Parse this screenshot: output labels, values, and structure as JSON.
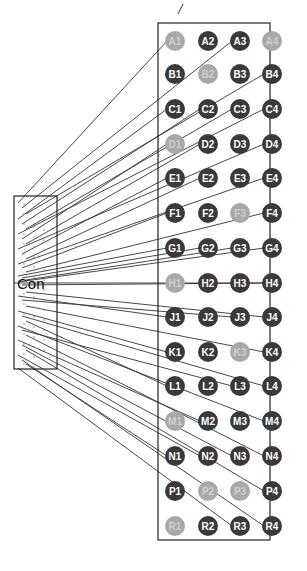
{
  "connector": {
    "label": "Con",
    "box": {
      "x": 14,
      "y": 196,
      "w": 43,
      "h": 173
    }
  },
  "grid": {
    "box": {
      "x": 158,
      "y": 23,
      "w": 112,
      "h": 517
    },
    "columns": [
      1,
      2,
      3,
      4
    ],
    "column_x": [
      175,
      208,
      240,
      272
    ],
    "row_letters": [
      "A",
      "B",
      "C",
      "D",
      "E",
      "F",
      "G",
      "H",
      "J",
      "K",
      "L",
      "M",
      "N",
      "P",
      "R"
    ],
    "row_y": [
      41,
      74,
      109,
      144,
      178,
      213,
      248,
      283,
      317,
      352,
      386,
      421,
      456,
      491,
      526
    ],
    "pin_radius": 10,
    "colors": {
      "dark": "#3a3a3a",
      "light": "#a9a9a9",
      "label_dark": "#ffffff",
      "label_light": "#cfcfcf",
      "wire": "#333333"
    },
    "light_pins": [
      "A1",
      "A4",
      "B2",
      "D1",
      "F3",
      "H1",
      "K3",
      "M1",
      "P2",
      "P3",
      "R1"
    ],
    "pins": [
      "A1",
      "A2",
      "A3",
      "A4",
      "B1",
      "B2",
      "B3",
      "B4",
      "C1",
      "C2",
      "C3",
      "C4",
      "D1",
      "D2",
      "D3",
      "D4",
      "E1",
      "E2",
      "E3",
      "E4",
      "F1",
      "F2",
      "F3",
      "F4",
      "G1",
      "G2",
      "G3",
      "G4",
      "H1",
      "H2",
      "H3",
      "H4",
      "J1",
      "J2",
      "J3",
      "J4",
      "K1",
      "K2",
      "K3",
      "K4",
      "L1",
      "L2",
      "L3",
      "L4",
      "M1",
      "M2",
      "M3",
      "M4",
      "N1",
      "N2",
      "N3",
      "N4",
      "P1",
      "P2",
      "P3",
      "P4",
      "R1",
      "R2",
      "R3",
      "R4"
    ]
  },
  "wires": [
    {
      "to": "A1",
      "from_y": 203
    },
    {
      "to": "A3",
      "from_y": 208
    },
    {
      "to": "B4",
      "from_y": 214
    },
    {
      "to": "C1",
      "from_y": 219
    },
    {
      "to": "C2",
      "from_y": 224
    },
    {
      "to": "C3",
      "from_y": 229
    },
    {
      "to": "C4",
      "from_y": 234
    },
    {
      "to": "D1",
      "from_y": 239
    },
    {
      "to": "D2",
      "from_y": 244
    },
    {
      "to": "D4",
      "from_y": 249
    },
    {
      "to": "E1",
      "from_y": 254
    },
    {
      "to": "E2",
      "from_y": 259
    },
    {
      "to": "E4",
      "from_y": 264
    },
    {
      "to": "F1",
      "from_y": 268
    },
    {
      "to": "F4",
      "from_y": 272
    },
    {
      "to": "G1",
      "from_y": 276
    },
    {
      "to": "G2",
      "from_y": 278
    },
    {
      "to": "G3",
      "from_y": 280
    },
    {
      "to": "G4",
      "from_y": 282
    },
    {
      "to": "H4",
      "from_y": 285
    },
    {
      "to": "J4",
      "from_y": 292
    },
    {
      "to": "J1",
      "from_y": 296
    },
    {
      "to": "J3",
      "from_y": 300
    },
    {
      "to": "K4",
      "from_y": 306
    },
    {
      "to": "K1",
      "from_y": 311
    },
    {
      "to": "L4",
      "from_y": 316
    },
    {
      "to": "L1",
      "from_y": 321
    },
    {
      "to": "M4",
      "from_y": 326
    },
    {
      "to": "L3",
      "from_y": 330
    },
    {
      "to": "N4",
      "from_y": 335
    },
    {
      "to": "M2",
      "from_y": 340
    },
    {
      "to": "N3",
      "from_y": 345
    },
    {
      "to": "P4",
      "from_y": 350
    },
    {
      "to": "N2",
      "from_y": 355
    },
    {
      "to": "R4",
      "from_y": 360
    },
    {
      "to": "N1",
      "from_y": 364
    },
    {
      "to": "R3",
      "from_y": 368
    }
  ]
}
